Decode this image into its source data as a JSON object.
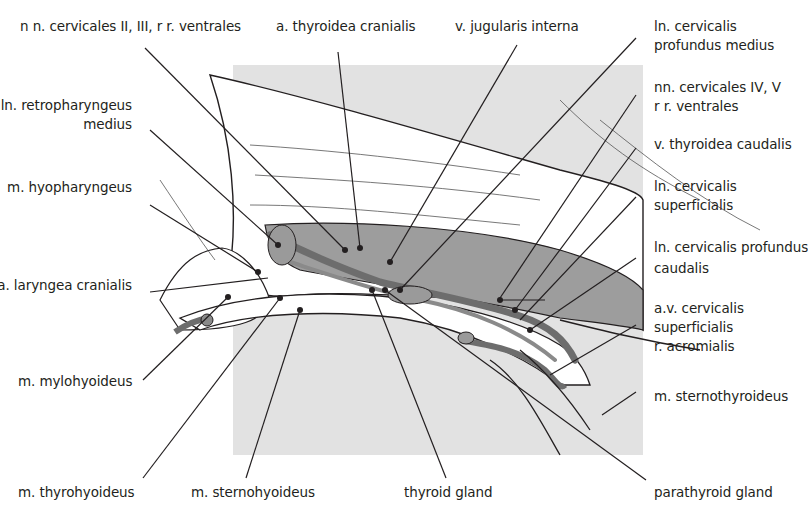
{
  "figure": {
    "background_color": "#e2e2e2",
    "muscle_fill": "#9a9a9a",
    "vessel_fill": "#6f6f6f",
    "line_color": "#231f20"
  },
  "labels": {
    "top": [
      {
        "id": "nn-cervicales-2-3",
        "lines": [
          "n n. cervicales II, III, r r. ventrales"
        ]
      },
      {
        "id": "a-thyroidea-cranialis",
        "lines": [
          "a. thyroidea cranialis"
        ]
      },
      {
        "id": "v-jugularis-interna",
        "lines": [
          "v. jugularis interna"
        ]
      }
    ],
    "left": [
      {
        "id": "ln-retropharyngeus-medius",
        "lines": [
          "ln. retropharyngeus",
          "medius"
        ]
      },
      {
        "id": "m-hyopharyngeus",
        "lines": [
          "m. hyopharyngeus"
        ]
      },
      {
        "id": "a-laryngea-cranialis",
        "lines": [
          "a. laryngea cranialis"
        ]
      },
      {
        "id": "m-mylohyoideus",
        "lines": [
          "m. mylohyoideus"
        ]
      }
    ],
    "right": [
      {
        "id": "ln-cervicalis-profundus-medius",
        "lines": [
          "ln. cervicalis",
          "profundus medius"
        ]
      },
      {
        "id": "nn-cervicales-4-5",
        "lines": [
          "nn. cervicales IV, V",
          "r r. ventrales"
        ]
      },
      {
        "id": "v-thyroidea-caudalis",
        "lines": [
          "v. thyroidea caudalis"
        ]
      },
      {
        "id": "ln-cervicalis-superficialis",
        "lines": [
          "ln. cervicalis",
          "superficialis"
        ]
      },
      {
        "id": "ln-cervicalis-profundus-caudalis",
        "lines": [
          "ln. cervicalis profundus",
          "caudalis"
        ]
      },
      {
        "id": "av-cervicalis-superficialis",
        "lines": [
          "a.v. cervicalis",
          "superficialis",
          "r. acromialis"
        ]
      },
      {
        "id": "m-sternothyroideus",
        "lines": [
          "m. sternothyroideus"
        ]
      }
    ],
    "bottom": [
      {
        "id": "m-thyrohyoideus",
        "lines": [
          "m. thyrohyoideus"
        ]
      },
      {
        "id": "m-sternohyoideus",
        "lines": [
          "m. sternohyoideus"
        ]
      },
      {
        "id": "thyroid-gland",
        "lines": [
          "thyroid gland"
        ]
      },
      {
        "id": "parathyroid-gland",
        "lines": [
          "parathyroid gland"
        ]
      }
    ]
  }
}
